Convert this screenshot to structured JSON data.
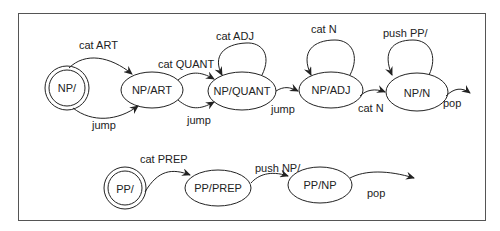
{
  "diagram": {
    "type": "augmented transition network",
    "networks": [
      {
        "name": "NP network",
        "nodes": [
          {
            "id": "np0",
            "label": "NP/",
            "initial": true
          },
          {
            "id": "np_art",
            "label": "NP/ART"
          },
          {
            "id": "np_quant",
            "label": "NP/QUANT"
          },
          {
            "id": "np_adj",
            "label": "NP/ADJ"
          },
          {
            "id": "np_n",
            "label": "NP/N"
          }
        ],
        "arcs": [
          {
            "from": "np0",
            "to": "np_art",
            "label": "cat ART"
          },
          {
            "from": "np0",
            "to": "np_art",
            "label": "jump"
          },
          {
            "from": "np_art",
            "to": "np_quant",
            "label": "cat QUANT"
          },
          {
            "from": "np_art",
            "to": "np_quant",
            "label": "jump"
          },
          {
            "from": "np_quant",
            "to": "np_quant",
            "label": "cat ADJ"
          },
          {
            "from": "np_quant",
            "to": "np_adj",
            "label": "jump"
          },
          {
            "from": "np_adj",
            "to": "np_adj",
            "label": "cat N"
          },
          {
            "from": "np_adj",
            "to": "np_n",
            "label": "cat N"
          },
          {
            "from": "np_n",
            "to": "np_n",
            "label": "push PP/"
          },
          {
            "from": "np_n",
            "to": null,
            "label": "pop"
          }
        ]
      },
      {
        "name": "PP network",
        "nodes": [
          {
            "id": "pp0",
            "label": "PP/",
            "initial": true
          },
          {
            "id": "pp_prep",
            "label": "PP/PREP"
          },
          {
            "id": "pp_np",
            "label": "PP/NP"
          }
        ],
        "arcs": [
          {
            "from": "pp0",
            "to": "pp_prep",
            "label": "cat PREP"
          },
          {
            "from": "pp_prep",
            "to": "pp_np",
            "label": "push NP/"
          },
          {
            "from": "pp_np",
            "to": null,
            "label": "pop"
          }
        ]
      }
    ]
  },
  "labels": {
    "np0": "NP/",
    "np_art": "NP/ART",
    "np_quant": "NP/QUANT",
    "np_adj": "NP/ADJ",
    "np_n": "NP/N",
    "pp0": "PP/",
    "pp_prep": "PP/PREP",
    "pp_np": "PP/NP",
    "arc_cat_art": "cat ART",
    "arc_jump1": "jump",
    "arc_cat_quant": "cat QUANT",
    "arc_jump2": "jump",
    "arc_cat_adj": "cat ADJ",
    "arc_jump3": "jump",
    "arc_cat_n_loop": "cat N",
    "arc_cat_n": "cat N",
    "arc_push_pp": "push PP/",
    "arc_pop_np": "pop",
    "arc_cat_prep": "cat PREP",
    "arc_push_np": "push NP/",
    "arc_pop_pp": "pop"
  },
  "colors": {
    "stroke": "#222222",
    "frame": "#555555",
    "background": "#ffffff"
  }
}
